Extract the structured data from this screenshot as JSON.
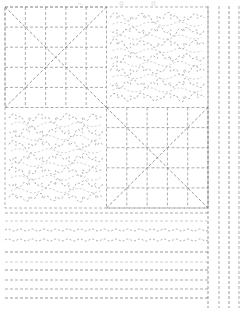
{
  "document": {
    "kind": "quilting-stitch-pattern-diagram",
    "title": "Quilting Pattern Layout",
    "canvas": {
      "width": 250,
      "height": 312,
      "background": "#ffffff"
    }
  },
  "style": {
    "stitch_color": "#8a8a8a",
    "stitch_color_dark": "#6f6f6f",
    "stitch_color_light": "#b9b9b9",
    "block_outline_color": "#9a9a9a",
    "dash_pattern": "3,2",
    "dash_pattern_fine": "2,2",
    "stroke_width": 0.7
  },
  "main_block": {
    "name": "four-patch-quilt-block",
    "x": 5,
    "y": 7,
    "width": 203,
    "height": 201,
    "quadrants": [
      {
        "position": "top-left",
        "pattern": "crosshatch-grid-with-diagonals",
        "grid_rows": 5,
        "grid_cols": 5,
        "diagonals": 2
      },
      {
        "position": "top-right",
        "pattern": "stipple-meander",
        "loops": 34
      },
      {
        "position": "bottom-left",
        "pattern": "stipple-meander",
        "loops": 34
      },
      {
        "position": "bottom-right",
        "pattern": "crosshatch-grid-with-diagonals",
        "grid_rows": 5,
        "grid_cols": 5,
        "diagonals": 2
      }
    ]
  },
  "border_band": {
    "name": "horizontal-stitch-band",
    "x": 5,
    "y": 208,
    "width": 203,
    "height": 100,
    "rows": [
      {
        "index": 1,
        "y": 213,
        "type": "straight-dashed",
        "weight": "medium"
      },
      {
        "index": 2,
        "y": 221,
        "type": "straight-dashed",
        "weight": "light"
      },
      {
        "index": 3,
        "y": 230,
        "type": "wavy-dashed",
        "amplitude": 2,
        "wavelength": 6
      },
      {
        "index": 4,
        "y": 240,
        "type": "wavy-dashed",
        "amplitude": 2,
        "wavelength": 6
      },
      {
        "index": 5,
        "y": 252,
        "type": "straight-dashed",
        "weight": "dark"
      },
      {
        "index": 6,
        "y": 262,
        "type": "straight-dashed",
        "weight": "light"
      },
      {
        "index": 7,
        "y": 270,
        "type": "straight-dashed",
        "weight": "dark"
      },
      {
        "index": 8,
        "y": 280,
        "type": "straight-dashed",
        "weight": "medium"
      },
      {
        "index": 9,
        "y": 289,
        "type": "straight-dashed",
        "weight": "medium"
      },
      {
        "index": 10,
        "y": 298,
        "type": "straight-dashed",
        "weight": "dark"
      }
    ]
  },
  "right_border": {
    "name": "vertical-stitch-border",
    "lines": [
      {
        "index": 1,
        "x": 208,
        "y1": 6,
        "y2": 308,
        "weight": "dark"
      },
      {
        "index": 2,
        "x": 219,
        "y1": 6,
        "y2": 308,
        "weight": "medium"
      },
      {
        "index": 3,
        "x": 229,
        "y1": 6,
        "y2": 308,
        "weight": "dark"
      },
      {
        "index": 4,
        "x": 239,
        "y1": 6,
        "y2": 308,
        "weight": "medium"
      }
    ]
  },
  "top_marks": {
    "name": "top-edge-registration-marks",
    "marks": [
      {
        "x": 78,
        "y": 2,
        "shape": "small-arc"
      },
      {
        "x": 120,
        "y": 2,
        "shape": "small-square"
      },
      {
        "x": 152,
        "y": 2,
        "shape": "small-square"
      }
    ]
  }
}
